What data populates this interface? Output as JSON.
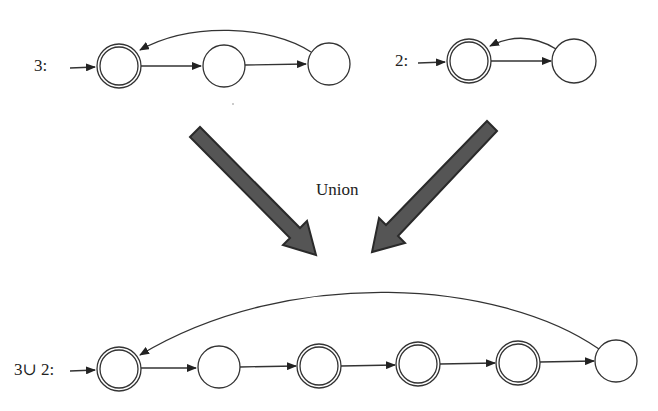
{
  "diagram": {
    "top_left": {
      "label": "3:",
      "states": [
        {
          "x": 119,
          "y": 66,
          "accepting": true
        },
        {
          "x": 224,
          "y": 66,
          "accepting": false
        },
        {
          "x": 329,
          "y": 64,
          "accepting": false
        }
      ]
    },
    "top_right": {
      "label": "2:",
      "states": [
        {
          "x": 469,
          "y": 61,
          "accepting": true
        },
        {
          "x": 574,
          "y": 61,
          "accepting": false
        }
      ]
    },
    "operation_label": "Union",
    "bottom": {
      "label": "3∪ 2:",
      "states": [
        {
          "x": 119,
          "y": 369,
          "accepting": true
        },
        {
          "x": 219,
          "y": 367,
          "accepting": false
        },
        {
          "x": 319,
          "y": 366,
          "accepting": true
        },
        {
          "x": 418,
          "y": 364,
          "accepting": true
        },
        {
          "x": 518,
          "y": 363,
          "accepting": true
        },
        {
          "x": 616,
          "y": 361,
          "accepting": false
        }
      ]
    },
    "colors": {
      "stroke": "#333333",
      "big_arrow": "#555555",
      "big_arrow_edge": "#2a2a2a"
    }
  }
}
